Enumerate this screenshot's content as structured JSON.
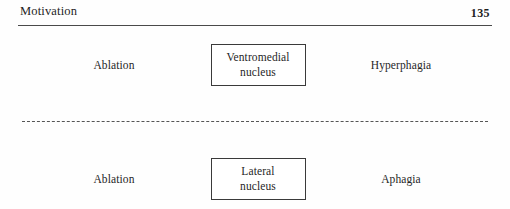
{
  "page": {
    "background_color": "#fefefe",
    "text_color": "#262626",
    "rule_color": "#4a4a4a"
  },
  "header": {
    "title": "Motivation",
    "folio": "135"
  },
  "diagram": {
    "divider_style": "dashed",
    "rows": [
      {
        "stimulus": "Ablation",
        "node_line1": "Ventromedial",
        "node_line2": "nucleus",
        "outcome": "Hyperphagia"
      },
      {
        "stimulus": "Ablation",
        "node_line1": "Lateral",
        "node_line2": "nucleus",
        "outcome": "Aphagia"
      }
    ]
  }
}
